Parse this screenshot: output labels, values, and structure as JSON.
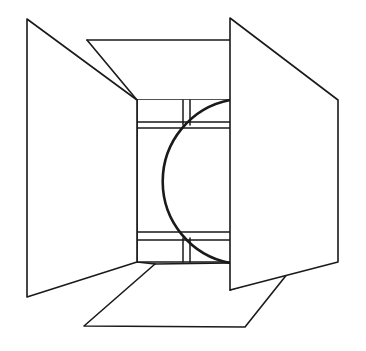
{
  "figure": {
    "canvas": {
      "width": 366,
      "height": 351
    },
    "colors": {
      "background": "#ffffff",
      "stroke": "#1a1a1a",
      "fill": "#ffffff"
    },
    "stroke_widths": {
      "panel_edge": 1.6,
      "inner_edge": 1.5,
      "sphere_outline": 2.6
    },
    "parts": [
      {
        "name": "left-panel",
        "label": "Left folded-open panel",
        "shape": "quadrilateral",
        "points": "27,19 137,100 137,262 27,297"
      },
      {
        "name": "right-panel",
        "label": "Right folded-open panel",
        "shape": "quadrilateral",
        "points": "230,18 338,100 338,262 230,290"
      },
      {
        "name": "top-panel",
        "label": "Top folded-open panel",
        "shape": "quadrilateral",
        "points": "87,40 230,40 230,100 137,100"
      },
      {
        "name": "bottom-panel",
        "label": "Bottom folded-open panel",
        "shape": "polygon",
        "points": "137,262 230,262 230,290 311,265 296,263 245,327 84,326 155,264"
      },
      {
        "name": "inner-back-wall",
        "label": "Interior back wall of the box",
        "shape": "rectangle",
        "points": "137,100 230,100 230,262 137,262"
      },
      {
        "name": "band-upper",
        "label": "Upper interior horizontal band",
        "y_top": 122,
        "y_bottom": 128,
        "x_left": 137,
        "x_right": 230
      },
      {
        "name": "band-lower",
        "label": "Lower interior horizontal band",
        "y_top": 232,
        "y_bottom": 240,
        "x_left": 137,
        "x_right": 230
      },
      {
        "name": "post-upper",
        "label": "Upper interior vertical post",
        "x_left": 183,
        "x_right": 190,
        "y_top": 100,
        "y_bottom": 125
      },
      {
        "name": "post-lower",
        "label": "Lower interior vertical post",
        "x_left": 183,
        "x_right": 190,
        "y_top": 238,
        "y_bottom": 262
      },
      {
        "name": "sphere",
        "label": "Inscribed sphere seen through the open box",
        "shape": "circle-arc",
        "center_x": 232,
        "center_y": 181,
        "radius": 83,
        "arc_start": "230,100",
        "arc_end": "230,263",
        "arc_apex_x": 149
      }
    ]
  }
}
